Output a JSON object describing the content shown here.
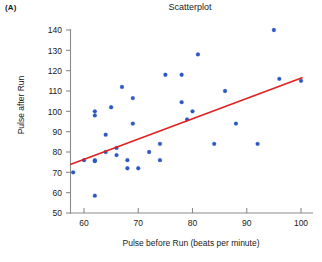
{
  "figure": {
    "panel_label": "(A)",
    "title": "Scatterplot",
    "background": "#ffffff"
  },
  "chart_data": {
    "type": "scatter",
    "title": "Scatterplot",
    "xlabel": "Pulse before Run (beats per minute)",
    "ylabel": "Pulse after Run",
    "xlim": [
      56,
      102
    ],
    "ylim": [
      50,
      143
    ],
    "xticks": [
      60,
      70,
      80,
      90,
      100
    ],
    "yticks": [
      50,
      60,
      70,
      80,
      90,
      100,
      110,
      120,
      130,
      140
    ],
    "grid": false,
    "legend": null,
    "marker_color": "#2b58c4",
    "points": [
      {
        "x": 58,
        "y": 70
      },
      {
        "x": 60,
        "y": 76
      },
      {
        "x": 62,
        "y": 58.5
      },
      {
        "x": 62,
        "y": 75.5
      },
      {
        "x": 62,
        "y": 76
      },
      {
        "x": 62,
        "y": 100
      },
      {
        "x": 62,
        "y": 98
      },
      {
        "x": 64,
        "y": 80
      },
      {
        "x": 64,
        "y": 88.5
      },
      {
        "x": 65,
        "y": 102
      },
      {
        "x": 66,
        "y": 78.5
      },
      {
        "x": 66,
        "y": 82
      },
      {
        "x": 67,
        "y": 112
      },
      {
        "x": 68,
        "y": 72
      },
      {
        "x": 68,
        "y": 76
      },
      {
        "x": 69,
        "y": 94
      },
      {
        "x": 69,
        "y": 106.5
      },
      {
        "x": 70,
        "y": 72
      },
      {
        "x": 72,
        "y": 80
      },
      {
        "x": 74,
        "y": 76
      },
      {
        "x": 74,
        "y": 84
      },
      {
        "x": 75,
        "y": 118
      },
      {
        "x": 78,
        "y": 104.5
      },
      {
        "x": 78,
        "y": 118
      },
      {
        "x": 79,
        "y": 96
      },
      {
        "x": 80,
        "y": 100
      },
      {
        "x": 81,
        "y": 128
      },
      {
        "x": 84,
        "y": 84
      },
      {
        "x": 86,
        "y": 110
      },
      {
        "x": 88,
        "y": 94
      },
      {
        "x": 92,
        "y": 84
      },
      {
        "x": 95,
        "y": 140
      },
      {
        "x": 96,
        "y": 116
      },
      {
        "x": 100,
        "y": 115
      }
    ],
    "fit_line": {
      "type": "linear-regression",
      "color": "#e02020",
      "x_start": 57.6,
      "y_start": 74.0,
      "x_end": 100.2,
      "y_end": 116.5
    }
  },
  "axes": {
    "x_tick_labels": [
      "60",
      "70",
      "80",
      "90",
      "100"
    ],
    "y_tick_labels": [
      "50",
      "60",
      "70",
      "80",
      "90",
      "100",
      "110",
      "120",
      "130",
      "140"
    ]
  }
}
